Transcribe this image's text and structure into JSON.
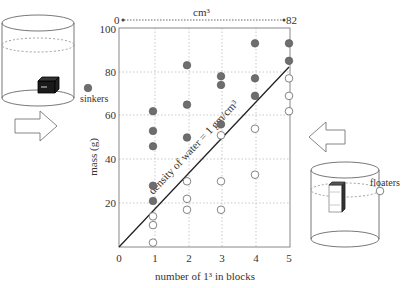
{
  "chart_data": {
    "type": "scatter",
    "title": "",
    "xlabel": "number of 1³ in blocks",
    "ylabel": "mass (g)",
    "xlim": [
      0,
      5
    ],
    "ylim": [
      0,
      100
    ],
    "x_ticks": [
      "0",
      "1",
      "2",
      "3",
      "4",
      "5"
    ],
    "y_ticks": [
      "20",
      "40",
      "60",
      "80",
      "100"
    ],
    "grid": true,
    "top_axis": {
      "label": "cm³",
      "start": "0",
      "end": "82"
    },
    "reference_line": {
      "label": "density of water = 1 gm/cm³",
      "from": [
        0,
        0
      ],
      "to": [
        5,
        82
      ]
    },
    "series": [
      {
        "name": "sinkers",
        "marker": "filled-circle",
        "color": "#6e6e6e",
        "points": [
          [
            1,
            62
          ],
          [
            1,
            53
          ],
          [
            1,
            46
          ],
          [
            1,
            28
          ],
          [
            1,
            21
          ],
          [
            2,
            83
          ],
          [
            2,
            65
          ],
          [
            2,
            50
          ],
          [
            3,
            78
          ],
          [
            3,
            74
          ],
          [
            3,
            56
          ],
          [
            4,
            93
          ],
          [
            4,
            77
          ],
          [
            4,
            69
          ],
          [
            5,
            93
          ],
          [
            5,
            85
          ]
        ]
      },
      {
        "name": "floaters",
        "marker": "open-circle",
        "color": "#ffffff",
        "points": [
          [
            1,
            14
          ],
          [
            1,
            10
          ],
          [
            1,
            2
          ],
          [
            2,
            30
          ],
          [
            2,
            22
          ],
          [
            2,
            17
          ],
          [
            3,
            51
          ],
          [
            3,
            30
          ],
          [
            3,
            17
          ],
          [
            4,
            54
          ],
          [
            4,
            33
          ],
          [
            5,
            77
          ],
          [
            5,
            69
          ],
          [
            5,
            62
          ]
        ]
      }
    ]
  },
  "legend": {
    "sinkers_label": "sinkers",
    "floaters_label": "floaters"
  },
  "illustrations": {
    "left_beaker": "sinking-block-beaker",
    "right_beaker": "floating-block-beaker",
    "left_arrow": "arrow-right-icon",
    "right_arrow": "arrow-left-icon"
  }
}
